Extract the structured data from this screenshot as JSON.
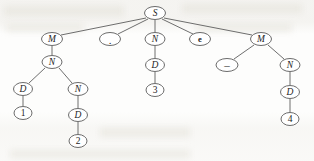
{
  "figure": {
    "ink_color": "#5a5a5a",
    "text_color": "#1d1d1d",
    "background_color": "#fdfdfc"
  },
  "nodes": [
    {
      "id": "s",
      "label": "S",
      "kind": "nonterminal",
      "cx": 155,
      "cy": 13,
      "rx": 10.5,
      "ry": 6.5
    },
    {
      "id": "m_left",
      "label": "M",
      "kind": "nonterminal",
      "cx": 52,
      "cy": 39,
      "rx": 10.5,
      "ry": 6.5
    },
    {
      "id": "dot",
      "label": ".",
      "kind": "terminal",
      "cx": 110,
      "cy": 39,
      "rx": 10.5,
      "ry": 6.5
    },
    {
      "id": "n_mid",
      "label": "N",
      "kind": "nonterminal",
      "cx": 155,
      "cy": 39,
      "rx": 10.0,
      "ry": 6.5
    },
    {
      "id": "e",
      "label": "e",
      "kind": "terminal",
      "cx": 200,
      "cy": 39,
      "rx": 10.5,
      "ry": 6.5
    },
    {
      "id": "m_right",
      "label": "M",
      "kind": "nonterminal",
      "cx": 261,
      "cy": 39,
      "rx": 10.5,
      "ry": 6.5
    },
    {
      "id": "n_left",
      "label": "N",
      "kind": "nonterminal",
      "cx": 52,
      "cy": 62,
      "rx": 10.0,
      "ry": 6.5
    },
    {
      "id": "d_mid",
      "label": "D",
      "kind": "nonterminal",
      "cx": 155,
      "cy": 65,
      "rx": 9.5,
      "ry": 6.5
    },
    {
      "id": "minus",
      "label": "–",
      "kind": "terminal",
      "cx": 227,
      "cy": 65,
      "rx": 11.0,
      "ry": 6.5
    },
    {
      "id": "n_right",
      "label": "N",
      "kind": "nonterminal",
      "cx": 290,
      "cy": 65,
      "rx": 10.0,
      "ry": 6.5
    },
    {
      "id": "d_ll",
      "label": "D",
      "kind": "nonterminal",
      "cx": 23,
      "cy": 89,
      "rx": 9.5,
      "ry": 6.5
    },
    {
      "id": "n_lr",
      "label": "N",
      "kind": "nonterminal",
      "cx": 78,
      "cy": 89,
      "rx": 10.0,
      "ry": 6.5
    },
    {
      "id": "three",
      "label": "3",
      "kind": "terminal",
      "cx": 155,
      "cy": 90,
      "rx": 9.0,
      "ry": 6.5
    },
    {
      "id": "d_right",
      "label": "D",
      "kind": "nonterminal",
      "cx": 290,
      "cy": 92,
      "rx": 9.5,
      "ry": 6.5
    },
    {
      "id": "one",
      "label": "1",
      "kind": "terminal",
      "cx": 23,
      "cy": 113,
      "rx": 9.0,
      "ry": 6.5
    },
    {
      "id": "d_lr",
      "label": "D",
      "kind": "nonterminal",
      "cx": 78,
      "cy": 115,
      "rx": 9.5,
      "ry": 6.5
    },
    {
      "id": "four",
      "label": "4",
      "kind": "terminal",
      "cx": 290,
      "cy": 119,
      "rx": 9.0,
      "ry": 6.5
    },
    {
      "id": "two",
      "label": "2",
      "kind": "terminal",
      "cx": 78,
      "cy": 141,
      "rx": 9.0,
      "ry": 6.5
    }
  ],
  "edges": [
    {
      "from": "s",
      "to": "m_left",
      "x1": 146,
      "y1": 18,
      "x2": 61,
      "y2": 35
    },
    {
      "from": "s",
      "to": "dot",
      "x1": 148,
      "y1": 19,
      "x2": 118,
      "y2": 34
    },
    {
      "from": "s",
      "to": "n_mid",
      "x1": 155,
      "y1": 20,
      "x2": 155,
      "y2": 32
    },
    {
      "from": "s",
      "to": "e",
      "x1": 162,
      "y1": 19,
      "x2": 193,
      "y2": 34
    },
    {
      "from": "s",
      "to": "m_right",
      "x1": 164,
      "y1": 18,
      "x2": 252,
      "y2": 35
    },
    {
      "from": "m_left",
      "to": "n_left",
      "x1": 52,
      "y1": 46,
      "x2": 52,
      "y2": 55
    },
    {
      "from": "n_left",
      "to": "d_ll",
      "x1": 45,
      "y1": 68,
      "x2": 29,
      "y2": 83
    },
    {
      "from": "n_left",
      "to": "n_lr",
      "x1": 59,
      "y1": 68,
      "x2": 72,
      "y2": 83
    },
    {
      "from": "d_ll",
      "to": "one",
      "x1": 23,
      "y1": 96,
      "x2": 23,
      "y2": 106
    },
    {
      "from": "n_lr",
      "to": "d_lr",
      "x1": 78,
      "y1": 96,
      "x2": 78,
      "y2": 108
    },
    {
      "from": "d_lr",
      "to": "two",
      "x1": 78,
      "y1": 122,
      "x2": 78,
      "y2": 134
    },
    {
      "from": "n_mid",
      "to": "d_mid",
      "x1": 155,
      "y1": 46,
      "x2": 155,
      "y2": 58
    },
    {
      "from": "d_mid",
      "to": "three",
      "x1": 155,
      "y1": 72,
      "x2": 155,
      "y2": 83
    },
    {
      "from": "m_right",
      "to": "minus",
      "x1": 254,
      "y1": 45,
      "x2": 234,
      "y2": 59
    },
    {
      "from": "m_right",
      "to": "n_right",
      "x1": 268,
      "y1": 45,
      "x2": 284,
      "y2": 59
    },
    {
      "from": "n_right",
      "to": "d_right",
      "x1": 290,
      "y1": 72,
      "x2": 290,
      "y2": 85
    },
    {
      "from": "d_right",
      "to": "four",
      "x1": 290,
      "y1": 99,
      "x2": 290,
      "y2": 112
    }
  ]
}
